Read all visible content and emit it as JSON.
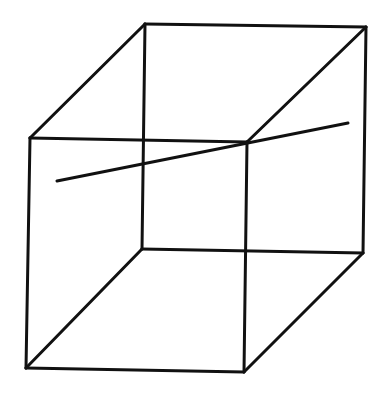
{
  "diagram": {
    "type": "wireframe-cube-with-line",
    "stroke_color": "#111111",
    "background_color": "#ffffff",
    "vertices": {
      "front_top_left": [
        30,
        138
      ],
      "front_top_right": [
        247,
        142
      ],
      "front_bottom_left": [
        26,
        368
      ],
      "front_bottom_right": [
        244,
        372
      ],
      "back_top_left": [
        145,
        24
      ],
      "back_top_right": [
        366,
        27
      ],
      "back_bottom_left": [
        142,
        249
      ],
      "back_bottom_right": [
        363,
        253
      ]
    },
    "edges": [
      [
        "front_top_left",
        "front_top_right"
      ],
      [
        "front_top_right",
        "front_bottom_right"
      ],
      [
        "front_bottom_right",
        "front_bottom_left"
      ],
      [
        "front_bottom_left",
        "front_top_left"
      ],
      [
        "back_top_left",
        "back_top_right"
      ],
      [
        "back_top_right",
        "back_bottom_right"
      ],
      [
        "back_bottom_right",
        "back_bottom_left"
      ],
      [
        "back_bottom_left",
        "back_top_left"
      ],
      [
        "front_top_left",
        "back_top_left"
      ],
      [
        "front_top_right",
        "back_top_right"
      ],
      [
        "front_bottom_left",
        "back_bottom_left"
      ],
      [
        "front_bottom_right",
        "back_bottom_right"
      ]
    ],
    "extra_line": {
      "start": [
        57,
        181
      ],
      "end": [
        348,
        123
      ]
    }
  }
}
